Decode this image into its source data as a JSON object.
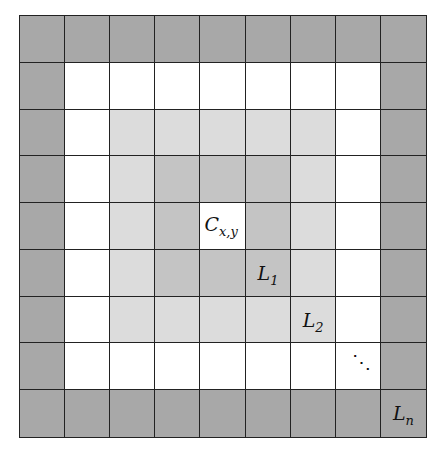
{
  "diagram": {
    "rows": 9,
    "cols": 9,
    "center": [
      4,
      4
    ],
    "ring_colors": [
      "#ffffff",
      "#c4c4c4",
      "#dcdcdc",
      "#ffffff",
      "#a8a8a8"
    ],
    "ring_names": [
      "center",
      "L1",
      "L2",
      "white-ring",
      "Ln"
    ],
    "labels": [
      {
        "id": "center",
        "row": 4,
        "col": 4,
        "main": "C",
        "sub": "x,y"
      },
      {
        "id": "l1",
        "row": 5,
        "col": 5,
        "main": "L",
        "sub": "1"
      },
      {
        "id": "l2",
        "row": 6,
        "col": 6,
        "main": "L",
        "sub": "2"
      },
      {
        "id": "dots",
        "row": 7,
        "col": 7,
        "main": "⋱",
        "sub": ""
      },
      {
        "id": "ln",
        "row": 8,
        "col": 8,
        "main": "L",
        "sub": "n"
      }
    ]
  }
}
